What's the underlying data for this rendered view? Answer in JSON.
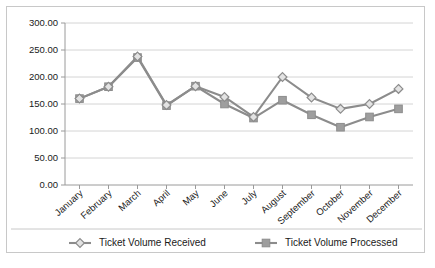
{
  "chart_data": {
    "type": "line",
    "title": "",
    "xlabel": "",
    "ylabel": "",
    "categories": [
      "January",
      "February",
      "March",
      "April",
      "May",
      "June",
      "July",
      "August",
      "September",
      "October",
      "November",
      "December"
    ],
    "series": [
      {
        "name": "Ticket Volume Received",
        "marker": "diamond",
        "color": "#8c8c8c",
        "values": [
          160,
          182,
          238,
          148,
          183,
          163,
          126,
          200,
          162,
          141,
          150,
          178
        ]
      },
      {
        "name": "Ticket Volume Processed",
        "marker": "square",
        "color": "#8c8c8c",
        "values": [
          160,
          182,
          236,
          147,
          183,
          150,
          124,
          157,
          130,
          107,
          126,
          141
        ]
      }
    ],
    "ylim": [
      0,
      300
    ],
    "ytick_step": 50,
    "ytick_labels": [
      "0.00",
      "50.00",
      "100.00",
      "150.00",
      "200.00",
      "250.00",
      "300.00"
    ],
    "grid": true,
    "legend_position": "bottom"
  },
  "colors": {
    "series_line": "#8c8c8c",
    "marker_fill": "#9e9e9e",
    "gridline": "#d4d4d4",
    "axis": "#9a9a9a",
    "frame_border": "#c8c8c8",
    "text": "#1a1a1a",
    "background": "#ffffff"
  }
}
